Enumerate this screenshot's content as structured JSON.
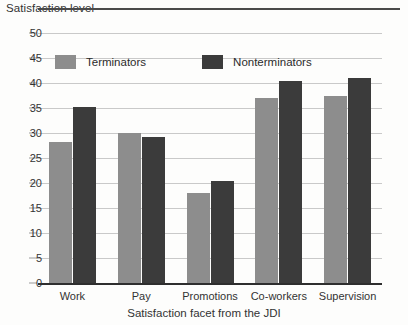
{
  "chart_data": {
    "type": "bar",
    "title": "",
    "ylabel": "Satisfaction level",
    "xlabel": "Satisfaction facet from the JDI",
    "categories": [
      "Work",
      "Pay",
      "Promotions",
      "Co-workers",
      "Supervision"
    ],
    "series": [
      {
        "name": "Terminators",
        "color": "#8d8d8d",
        "values": [
          28.3,
          30.1,
          18.0,
          37.0,
          37.4
        ]
      },
      {
        "name": "Nonterminators",
        "color": "#3b3b3b",
        "values": [
          35.3,
          29.2,
          20.4,
          40.5,
          41.0
        ]
      }
    ],
    "ylim": [
      0,
      50
    ],
    "yticks": [
      0,
      5,
      10,
      15,
      20,
      25,
      30,
      35,
      40,
      45,
      50
    ],
    "ytick_labels": [
      "0",
      "5",
      "10",
      "15",
      "20",
      "25",
      "30",
      "35",
      "40",
      "45",
      "50"
    ],
    "grid": true,
    "legend_position": "upper-left-inside"
  }
}
